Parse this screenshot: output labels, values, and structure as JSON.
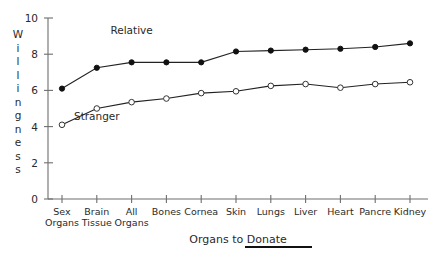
{
  "chart_data": {
    "type": "line",
    "title": "",
    "xlabel": "Organs to Donate",
    "ylabel": "Willingness",
    "ylim": [
      0,
      10
    ],
    "yticks": [
      0,
      2,
      4,
      6,
      8,
      10
    ],
    "ytick_labels": [
      "0",
      "2",
      "4",
      "6",
      "8",
      "10"
    ],
    "grid": false,
    "legend_position": "inline-annotation",
    "categories": [
      "Sex Organs",
      "Brain Tissue",
      "All Organs",
      "Bones",
      "Cornea",
      "Skin",
      "Lungs",
      "Liver",
      "Heart",
      "Pancre",
      "Kidney"
    ],
    "category_lines": [
      [
        "Sex",
        "Organs"
      ],
      [
        "Brain",
        "Tissue"
      ],
      [
        "All",
        "Organs"
      ],
      [
        "Bones",
        ""
      ],
      [
        "Cornea",
        ""
      ],
      [
        "Skin",
        ""
      ],
      [
        "Lungs",
        ""
      ],
      [
        "Liver",
        ""
      ],
      [
        "Heart",
        ""
      ],
      [
        "Pancre",
        ""
      ],
      [
        "Kidney",
        ""
      ]
    ],
    "series": [
      {
        "name": "Relative",
        "marker": "filled-circle",
        "values": [
          6.1,
          7.25,
          7.55,
          7.55,
          7.55,
          8.15,
          8.2,
          8.25,
          8.3,
          8.4,
          8.6
        ]
      },
      {
        "name": "Stranger",
        "marker": "open-circle",
        "values": [
          4.1,
          5.0,
          5.35,
          5.55,
          5.85,
          5.95,
          6.25,
          6.35,
          6.15,
          6.35,
          6.45
        ]
      }
    ],
    "annotations": [
      {
        "text": "Relative",
        "x_category": "All Organs",
        "y_value": 9.1
      },
      {
        "text": "Stranger",
        "x_category": "Brain Tissue",
        "y_value": 4.35
      }
    ]
  },
  "colors": {
    "axis": "#6e6e6e",
    "line": "#222222",
    "marker_filled": "#111111",
    "marker_open_fill": "#ffffff",
    "text": "#2a2a2a",
    "background": "#ffffff"
  }
}
